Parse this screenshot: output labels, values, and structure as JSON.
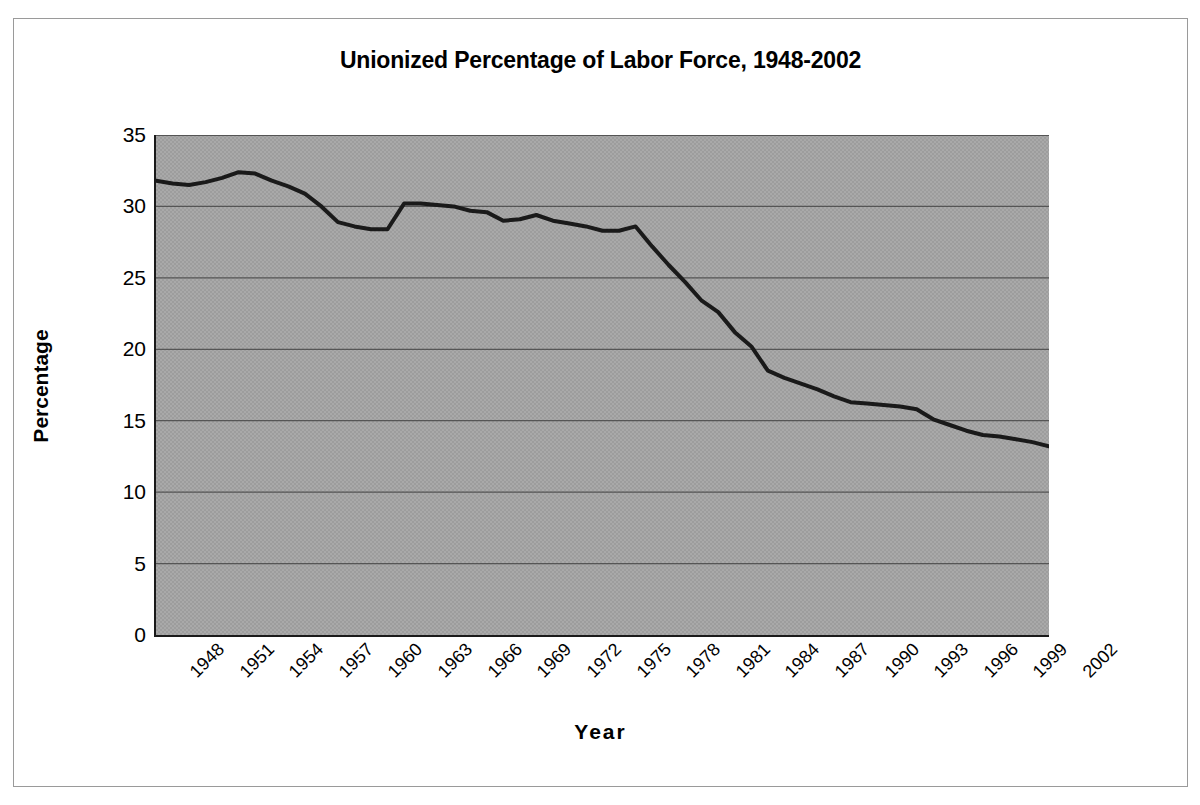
{
  "chart_data": {
    "type": "line",
    "title": "Unionized Percentage of Labor Force, 1948-2002",
    "xlabel": "Year",
    "ylabel": "Percentage",
    "xlim": [
      1948,
      2002
    ],
    "ylim": [
      0,
      35
    ],
    "yticks": [
      0,
      5,
      10,
      15,
      20,
      25,
      30,
      35
    ],
    "ytick_labels": [
      "0",
      "5",
      "10",
      "15",
      "20",
      "25",
      "30",
      "35"
    ],
    "xtick_labels": [
      "1948",
      "1951",
      "1954",
      "1957",
      "1960",
      "1963",
      "1966",
      "1969",
      "1972",
      "1975",
      "1978",
      "1981",
      "1984",
      "1987",
      "1990",
      "1993",
      "1996",
      "1999",
      "2002"
    ],
    "xtick_step": 3,
    "grid": "horizontal",
    "legend": null,
    "plot_background": "#a9a9a9",
    "line_color": "#1a1a1a",
    "line_width": 4,
    "series": [
      {
        "name": "Unionized Percentage of Labor Force",
        "x": [
          1948,
          1949,
          1950,
          1951,
          1952,
          1953,
          1954,
          1955,
          1956,
          1957,
          1958,
          1959,
          1960,
          1961,
          1962,
          1963,
          1964,
          1965,
          1966,
          1967,
          1968,
          1969,
          1970,
          1971,
          1972,
          1973,
          1974,
          1975,
          1976,
          1977,
          1978,
          1979,
          1980,
          1981,
          1982,
          1983,
          1984,
          1985,
          1986,
          1987,
          1988,
          1989,
          1990,
          1991,
          1992,
          1993,
          1994,
          1995,
          1996,
          1997,
          1998,
          1999,
          2000,
          2001,
          2002
        ],
        "values": [
          31.8,
          31.6,
          31.5,
          31.7,
          32.0,
          32.4,
          32.3,
          31.8,
          31.4,
          30.9,
          30.0,
          28.9,
          28.6,
          28.4,
          28.4,
          30.2,
          30.2,
          30.1,
          30.0,
          29.7,
          29.6,
          29.0,
          29.1,
          29.4,
          29.0,
          28.8,
          28.6,
          28.3,
          28.3,
          28.6,
          27.2,
          25.9,
          24.7,
          23.4,
          22.6,
          21.2,
          20.2,
          18.5,
          18.0,
          17.6,
          17.2,
          16.7,
          16.3,
          16.2,
          16.1,
          16.0,
          15.8,
          15.1,
          14.7,
          14.3,
          14.0,
          13.9,
          13.7,
          13.5,
          13.2
        ]
      }
    ]
  },
  "figure": {
    "border_color": "#9a9a9a",
    "background": "#ffffff"
  }
}
